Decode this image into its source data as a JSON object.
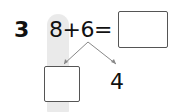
{
  "problem": {
    "number": "3",
    "expression": "8+6=",
    "answer_box": "",
    "decomposition": {
      "left_box": "",
      "right_value": "4"
    }
  },
  "colors": {
    "text": "#111111",
    "box_border": "#555555",
    "highlight": "#e6e6e6",
    "lines": "#888888"
  }
}
